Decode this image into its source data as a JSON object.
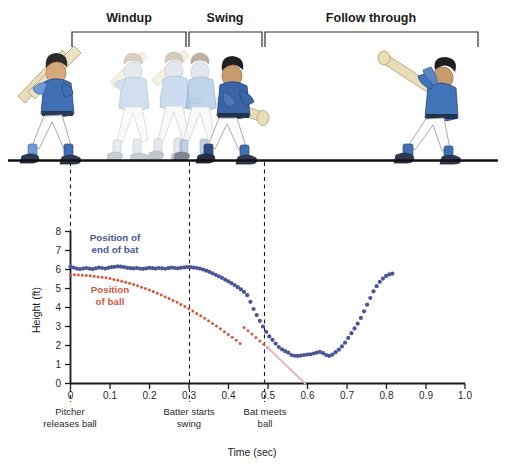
{
  "figure": {
    "phases": [
      {
        "label": "Windup",
        "x_start": 72,
        "x_end": 186,
        "label_x": 129
      },
      {
        "label": "Swing",
        "x_start": 188,
        "x_end": 262,
        "label_x": 225
      },
      {
        "label": "Follow through",
        "x_start": 264,
        "x_end": 478,
        "label_x": 371
      }
    ],
    "ground_line": {
      "y": 160,
      "x_start": 8,
      "x_end": 498
    },
    "figures_caption": "batter stop-motion sequence"
  },
  "chart_data": {
    "type": "scatter",
    "title": "",
    "xlabel": "Time (sec)",
    "ylabel": "Height (ft)",
    "xlim": [
      0,
      1.0
    ],
    "ylim": [
      0,
      8
    ],
    "xticks": [
      "0",
      "0.1",
      "0.2",
      "0.3",
      "0.4",
      "0.5",
      "0.6",
      "0.7",
      "0.8",
      "0.9",
      "1.0"
    ],
    "yticks": [
      "0",
      "1",
      "2",
      "3",
      "4",
      "5",
      "6",
      "7",
      "8"
    ],
    "grid": false,
    "legend_position": "inline-annotations",
    "series": [
      {
        "name": "Position of end of bat",
        "color": "#4a5699",
        "marker": "dot",
        "x": [
          0.0,
          0.008,
          0.016,
          0.024,
          0.032,
          0.04,
          0.048,
          0.056,
          0.064,
          0.072,
          0.08,
          0.088,
          0.096,
          0.104,
          0.112,
          0.12,
          0.128,
          0.136,
          0.144,
          0.152,
          0.16,
          0.168,
          0.176,
          0.184,
          0.192,
          0.2,
          0.208,
          0.216,
          0.224,
          0.232,
          0.24,
          0.248,
          0.256,
          0.264,
          0.272,
          0.28,
          0.288,
          0.296,
          0.304,
          0.312,
          0.32,
          0.328,
          0.336,
          0.344,
          0.352,
          0.36,
          0.368,
          0.376,
          0.384,
          0.392,
          0.4,
          0.408,
          0.416,
          0.424,
          0.432,
          0.44,
          0.448,
          0.456,
          0.464,
          0.472,
          0.48,
          0.488,
          0.496,
          0.504,
          0.512,
          0.52,
          0.528,
          0.536,
          0.544,
          0.552,
          0.56,
          0.568,
          0.576,
          0.584,
          0.592,
          0.6,
          0.608,
          0.616,
          0.624,
          0.632,
          0.64,
          0.648,
          0.656,
          0.664,
          0.672,
          0.68,
          0.688,
          0.696,
          0.704,
          0.712,
          0.72,
          0.728,
          0.736,
          0.744,
          0.752,
          0.76,
          0.768,
          0.776,
          0.784,
          0.792,
          0.8,
          0.808,
          0.816
        ],
        "y": [
          6.15,
          6.1,
          6.05,
          6.02,
          6.05,
          6.08,
          6.05,
          6.02,
          6.06,
          6.1,
          6.08,
          6.05,
          6.09,
          6.12,
          6.14,
          6.16,
          6.15,
          6.12,
          6.09,
          6.07,
          6.06,
          6.08,
          6.05,
          6.03,
          6.06,
          6.09,
          6.07,
          6.05,
          6.08,
          6.06,
          6.04,
          6.07,
          6.1,
          6.08,
          6.06,
          6.09,
          6.11,
          6.13,
          6.12,
          6.1,
          6.08,
          6.05,
          6.0,
          5.94,
          5.88,
          5.8,
          5.72,
          5.64,
          5.56,
          5.47,
          5.38,
          5.28,
          5.18,
          5.07,
          4.95,
          4.82,
          4.65,
          4.3,
          3.92,
          3.6,
          3.3,
          3.0,
          2.72,
          2.48,
          2.3,
          2.1,
          1.92,
          1.8,
          1.7,
          1.62,
          1.5,
          1.46,
          1.45,
          1.47,
          1.5,
          1.52,
          1.54,
          1.58,
          1.62,
          1.66,
          1.6,
          1.5,
          1.45,
          1.52,
          1.65,
          1.78,
          1.95,
          2.15,
          2.4,
          2.65,
          2.9,
          3.15,
          3.45,
          3.8,
          4.15,
          4.5,
          4.85,
          5.12,
          5.35,
          5.52,
          5.66,
          5.74,
          5.78
        ],
        "note": "bat end: level ~6.1 ft during windup, sweeps down to contact at t=0.50, dips to ~1.45 ft, then rises through follow-through to ~5.8 ft peak near t=0.74 and falls to ~5.2 ft"
      },
      {
        "name": "Position of ball",
        "color": "#d9573f",
        "marker": "dot",
        "x": [
          0.0,
          0.01,
          0.02,
          0.03,
          0.04,
          0.05,
          0.06,
          0.07,
          0.08,
          0.09,
          0.1,
          0.11,
          0.12,
          0.13,
          0.14,
          0.15,
          0.16,
          0.17,
          0.18,
          0.19,
          0.2,
          0.21,
          0.22,
          0.23,
          0.24,
          0.25,
          0.26,
          0.27,
          0.28,
          0.29,
          0.3,
          0.31,
          0.32,
          0.33,
          0.34,
          0.35,
          0.36,
          0.37,
          0.38,
          0.39,
          0.4,
          0.41,
          0.42,
          0.43,
          0.44,
          0.45,
          0.46,
          0.47,
          0.48,
          0.49,
          0.5
        ],
        "y": [
          5.72,
          5.72,
          5.71,
          5.7,
          5.69,
          5.67,
          5.65,
          5.62,
          5.59,
          5.56,
          5.52,
          5.48,
          5.43,
          5.38,
          5.33,
          5.27,
          5.21,
          5.14,
          5.07,
          5.0,
          4.92,
          4.84,
          4.75,
          4.66,
          4.57,
          4.47,
          4.37,
          4.27,
          4.16,
          4.05,
          3.93,
          3.81,
          3.69,
          3.56,
          3.43,
          3.3,
          3.16,
          3.02,
          2.88,
          2.73,
          2.58,
          2.43,
          2.27,
          2.11,
          2.95,
          2.78,
          2.6,
          2.42,
          2.24,
          2.06,
          1.88
        ],
        "note": "pitched ball falls from 5.72 ft release to ~1.9 ft at the plate (t=0.50)"
      },
      {
        "name": "Ball projected path (uncontacted)",
        "color": "#e8b4c4",
        "marker": "line",
        "x": [
          0.5,
          0.595
        ],
        "y": [
          1.88,
          0.0
        ],
        "note": "faint pink extrapolation of the ball trajectory to the ground"
      }
    ],
    "annotations": [
      {
        "text": "Position of end of bat",
        "series": "bat",
        "x": 0.115,
        "y": 7.3
      },
      {
        "text": "Position of ball",
        "series": "ball",
        "x": 0.095,
        "y": 4.85
      }
    ],
    "events": [
      {
        "label_line1": "Pitcher",
        "label_line2": "releases ball",
        "x": 0.0
      },
      {
        "label_line1": "Batter starts",
        "label_line2": "swing",
        "x": 0.3
      },
      {
        "label_line1": "Bat meets",
        "label_line2": "ball",
        "x": 0.5
      }
    ]
  },
  "colors": {
    "bat": "#4a5699",
    "ball": "#d9573f",
    "ball_projection": "#e8b4c4",
    "axis": "#1b1b1b",
    "dashed": "#1b1b1b",
    "jersey_main": "#3f6fb5",
    "jersey_faded": "#a8c6e2",
    "bat_wood": "#e8ddb8",
    "skin": "#d9a878",
    "shoe_dark": "#2f3a52",
    "shoe_faded": "#9aa3ad"
  }
}
